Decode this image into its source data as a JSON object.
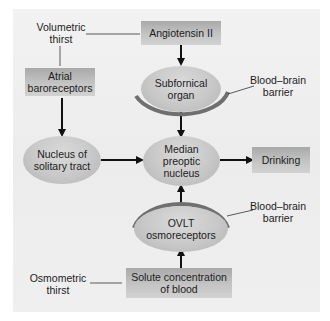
{
  "diagram": {
    "labels": {
      "volumetric_thirst": "Volumetric\nthirst",
      "osmometric_thirst": "Osmometric\nthirst",
      "bbb_top": "Blood–brain\nbarrier",
      "bbb_bottom": "Blood–brain\nbarrier"
    },
    "boxes": {
      "angiotensin": "Angiotensin II",
      "atrial": "Atrial\nbaroreceptors",
      "drinking": "Drinking",
      "solute": "Solute concentration\nof blood"
    },
    "ovals": {
      "subfornical": "Subfornical\norgan",
      "solitary": "Nucleus of\nsolitary tract",
      "median": "Median\npreoptic\nnucleus",
      "ovlt": "OVLT\nosmoreceptors"
    },
    "colors": {
      "panel_bg": "#eeeeee",
      "box_fill": "#bdbdbd",
      "oval_fill": "#c8c8c8",
      "barrier_arc": "#6f6f6f",
      "arrow": "#111111"
    }
  }
}
